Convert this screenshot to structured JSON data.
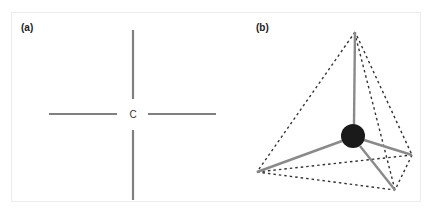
{
  "figure": {
    "panel_a": {
      "label": "(a)",
      "center_label": "C",
      "line_color": "#808080",
      "arms": [
        {
          "name": "top",
          "x1": 133,
          "y1": 30,
          "x2": 133,
          "y2": 99
        },
        {
          "name": "bottom",
          "x1": 133,
          "y1": 130,
          "x2": 133,
          "y2": 200
        },
        {
          "name": "left",
          "x1": 49,
          "y1": 114,
          "x2": 117,
          "y2": 114
        },
        {
          "name": "right",
          "x1": 148,
          "y1": 114,
          "x2": 216,
          "y2": 114
        }
      ]
    },
    "panel_b": {
      "label": "(b)",
      "atom_color": "#1a1a1a",
      "bond_color": "#8a8a8a",
      "edge_color": "#333333",
      "center": {
        "x": 353,
        "y": 136,
        "r": 12
      },
      "vertices": [
        {
          "name": "apex",
          "x": 355,
          "y": 32
        },
        {
          "name": "left",
          "x": 257,
          "y": 172
        },
        {
          "name": "right",
          "x": 412,
          "y": 155
        },
        {
          "name": "front",
          "x": 395,
          "y": 190
        }
      ]
    }
  }
}
